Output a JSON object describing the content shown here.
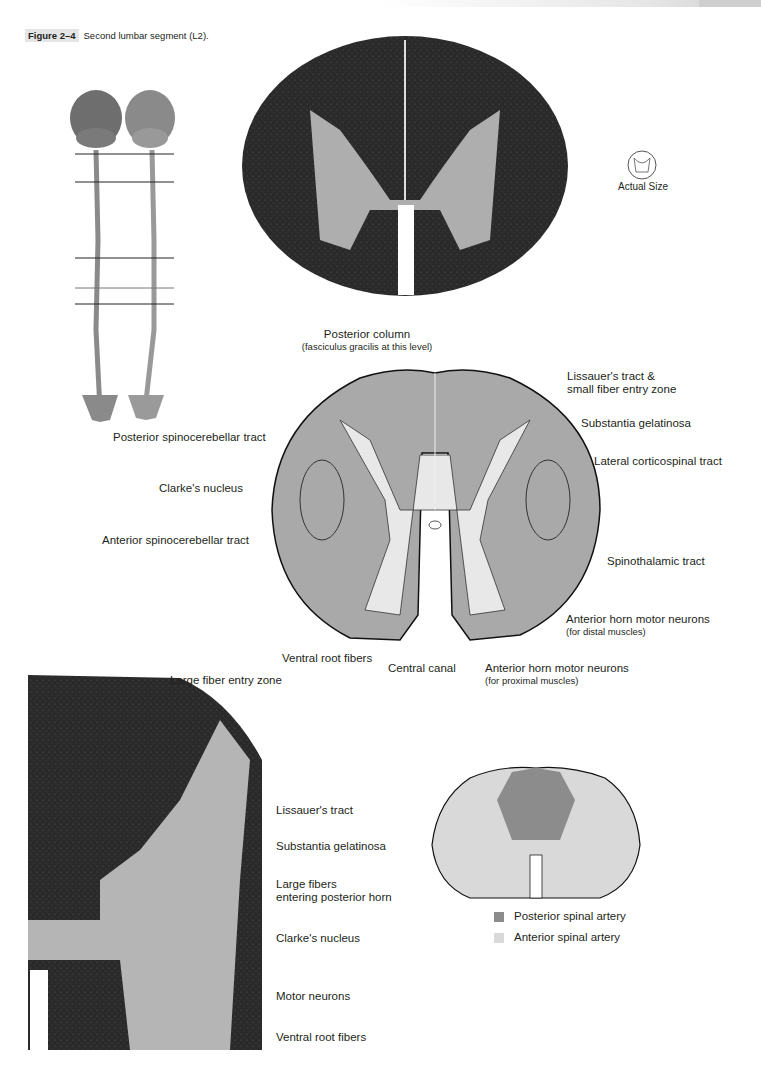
{
  "figure": {
    "number": "Figure 2–4",
    "title": "Second lumbar segment (L2)."
  },
  "actual_size": {
    "label": "Actual Size"
  },
  "diagram_labels": {
    "posterior_column": "Posterior column",
    "posterior_column_sub": "(fasciculus gracilis at this level)",
    "lissauer_entry": "Lissauer's tract &",
    "lissauer_entry_2": "small fiber entry zone",
    "substantia_gelatinosa": "Substantia gelatinosa",
    "lateral_corticospinal": "Lateral corticospinal tract",
    "posterior_spinocerebellar": "Posterior spinocerebellar tract",
    "clarkes_nucleus": "Clarke's nucleus",
    "anterior_spinocerebellar": "Anterior spinocerebellar tract",
    "spinothalamic": "Spinothalamic tract",
    "ant_horn_distal": "Anterior horn motor neurons",
    "ant_horn_distal_sub": "(for distal muscles)",
    "ventral_root": "Ventral root fibers",
    "central_canal": "Central canal",
    "ant_horn_proximal": "Anterior horn motor neurons",
    "ant_horn_proximal_sub": "(for proximal muscles)"
  },
  "photo_labels": {
    "large_fiber_entry": "Large fiber entry zone",
    "lissauer": "Lissauer's tract",
    "substantia_gelatinosa": "Substantia gelatinosa",
    "large_fibers": "Large fibers",
    "large_fibers_2": "entering posterior horn",
    "clarkes_nucleus": "Clarke's nucleus",
    "motor_neurons": "Motor neurons",
    "ventral_root": "Ventral root fibers"
  },
  "legend": {
    "items": [
      {
        "label": "Posterior spinal artery",
        "color": "#8c8c8c"
      },
      {
        "label": "Anterior spinal artery",
        "color": "#d9d9d9"
      }
    ]
  },
  "level_lines": {
    "count": 5
  }
}
